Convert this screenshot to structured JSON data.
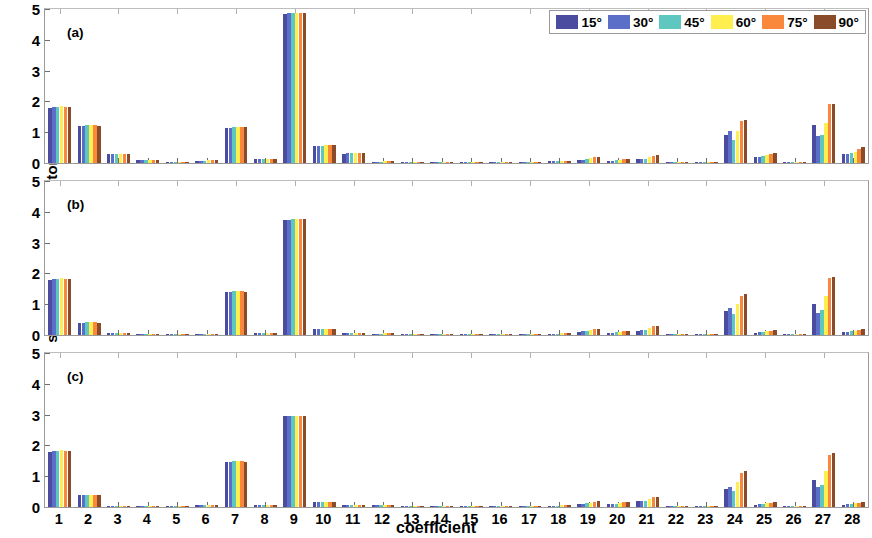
{
  "chart_data": {
    "type": "bar",
    "title": "",
    "xlabel": "coefficient",
    "ylabel": "sensitivity analysis factors",
    "ylim": [
      0,
      5
    ],
    "yticks": [
      0,
      1,
      2,
      3,
      4,
      5
    ],
    "grid": false,
    "legend_position": "top-right",
    "categories": [
      1,
      2,
      3,
      4,
      5,
      6,
      7,
      8,
      9,
      10,
      11,
      12,
      13,
      14,
      15,
      16,
      17,
      18,
      19,
      20,
      21,
      22,
      23,
      24,
      25,
      26,
      27,
      28
    ],
    "panels": [
      {
        "tag": "(a)",
        "series": [
          {
            "name": "15°",
            "color": "#4b4ba0",
            "values": [
              1.8,
              1.2,
              0.28,
              0.1,
              0.01,
              0.08,
              1.14,
              0.13,
              4.85,
              0.55,
              0.3,
              0.04,
              0.02,
              0.01,
              0.01,
              0.01,
              0.01,
              0.06,
              0.1,
              0.07,
              0.12,
              0.02,
              0.02,
              0.92,
              0.18,
              0.02,
              1.25,
              0.28
            ]
          },
          {
            "name": "30°",
            "color": "#5b6ec8",
            "values": [
              1.82,
              1.21,
              0.28,
              0.1,
              0.01,
              0.08,
              1.15,
              0.13,
              4.86,
              0.56,
              0.31,
              0.04,
              0.02,
              0.01,
              0.01,
              0.01,
              0.01,
              0.06,
              0.11,
              0.08,
              0.13,
              0.02,
              0.02,
              1.04,
              0.2,
              0.02,
              0.88,
              0.3
            ]
          },
          {
            "name": "45°",
            "color": "#5ec8c0",
            "values": [
              1.83,
              1.22,
              0.29,
              0.1,
              0.01,
              0.08,
              1.16,
              0.13,
              4.87,
              0.56,
              0.31,
              0.04,
              0.02,
              0.01,
              0.01,
              0.01,
              0.01,
              0.06,
              0.12,
              0.09,
              0.14,
              0.02,
              0.02,
              0.76,
              0.22,
              0.02,
              0.92,
              0.32
            ]
          },
          {
            "name": "60°",
            "color": "#ffef4e",
            "values": [
              1.84,
              1.22,
              0.29,
              0.11,
              0.01,
              0.09,
              1.17,
              0.14,
              4.88,
              0.57,
              0.32,
              0.05,
              0.02,
              0.01,
              0.01,
              0.01,
              0.01,
              0.07,
              0.15,
              0.11,
              0.2,
              0.03,
              0.02,
              1.05,
              0.26,
              0.02,
              1.3,
              0.36
            ]
          },
          {
            "name": "75°",
            "color": "#f9873c",
            "values": [
              1.83,
              1.22,
              0.3,
              0.11,
              0.01,
              0.09,
              1.17,
              0.14,
              4.88,
              0.57,
              0.32,
              0.05,
              0.02,
              0.01,
              0.01,
              0.01,
              0.01,
              0.08,
              0.18,
              0.13,
              0.24,
              0.03,
              0.02,
              1.35,
              0.3,
              0.02,
              1.9,
              0.44
            ]
          },
          {
            "name": "90°",
            "color": "#8a4b2a",
            "values": [
              1.82,
              1.21,
              0.3,
              0.11,
              0.01,
              0.09,
              1.16,
              0.14,
              4.87,
              0.57,
              0.32,
              0.05,
              0.02,
              0.01,
              0.01,
              0.01,
              0.01,
              0.08,
              0.19,
              0.14,
              0.25,
              0.03,
              0.02,
              1.4,
              0.32,
              0.02,
              1.93,
              0.52
            ]
          }
        ]
      },
      {
        "tag": "(b)",
        "series": [
          {
            "name": "15°",
            "color": "#4b4ba0",
            "values": [
              1.8,
              0.4,
              0.05,
              0.01,
              0.01,
              0.03,
              1.4,
              0.05,
              3.74,
              0.18,
              0.06,
              0.04,
              0.01,
              0.01,
              0.01,
              0.01,
              0.01,
              0.04,
              0.11,
              0.07,
              0.14,
              0.02,
              0.01,
              0.78,
              0.08,
              0.01,
              1.02,
              0.1
            ]
          },
          {
            "name": "30°",
            "color": "#5b6ec8",
            "values": [
              1.82,
              0.4,
              0.05,
              0.01,
              0.01,
              0.03,
              1.41,
              0.05,
              3.75,
              0.18,
              0.06,
              0.04,
              0.01,
              0.01,
              0.01,
              0.01,
              0.01,
              0.04,
              0.12,
              0.08,
              0.15,
              0.02,
              0.01,
              0.88,
              0.09,
              0.01,
              0.72,
              0.11
            ]
          },
          {
            "name": "45°",
            "color": "#5ec8c0",
            "values": [
              1.83,
              0.41,
              0.05,
              0.01,
              0.01,
              0.03,
              1.42,
              0.05,
              3.76,
              0.18,
              0.06,
              0.04,
              0.01,
              0.01,
              0.01,
              0.01,
              0.01,
              0.04,
              0.13,
              0.09,
              0.16,
              0.02,
              0.01,
              0.68,
              0.1,
              0.01,
              0.8,
              0.12
            ]
          },
          {
            "name": "60°",
            "color": "#ffef4e",
            "values": [
              1.84,
              0.41,
              0.05,
              0.01,
              0.01,
              0.03,
              1.42,
              0.05,
              3.77,
              0.19,
              0.06,
              0.05,
              0.01,
              0.01,
              0.01,
              0.01,
              0.01,
              0.05,
              0.16,
              0.11,
              0.22,
              0.03,
              0.01,
              1.0,
              0.12,
              0.01,
              1.28,
              0.14
            ]
          },
          {
            "name": "75°",
            "color": "#f9873c",
            "values": [
              1.83,
              0.41,
              0.05,
              0.01,
              0.01,
              0.03,
              1.42,
              0.05,
              3.77,
              0.19,
              0.06,
              0.05,
              0.01,
              0.01,
              0.01,
              0.01,
              0.01,
              0.06,
              0.19,
              0.13,
              0.28,
              0.03,
              0.01,
              1.28,
              0.14,
              0.01,
              1.86,
              0.17
            ]
          },
          {
            "name": "90°",
            "color": "#8a4b2a",
            "values": [
              1.82,
              0.4,
              0.05,
              0.01,
              0.01,
              0.03,
              1.41,
              0.05,
              3.76,
              0.19,
              0.06,
              0.05,
              0.01,
              0.01,
              0.01,
              0.01,
              0.01,
              0.06,
              0.2,
              0.14,
              0.3,
              0.03,
              0.01,
              1.34,
              0.15,
              0.01,
              1.88,
              0.18
            ]
          }
        ]
      },
      {
        "tag": "(c)",
        "series": [
          {
            "name": "15°",
            "color": "#4b4ba0",
            "values": [
              1.8,
              0.38,
              0.04,
              0.01,
              0.01,
              0.07,
              1.46,
              0.05,
              2.94,
              0.16,
              0.05,
              0.05,
              0.02,
              0.02,
              0.02,
              0.02,
              0.02,
              0.04,
              0.1,
              0.09,
              0.18,
              0.02,
              0.01,
              0.58,
              0.08,
              0.01,
              0.88,
              0.08
            ]
          },
          {
            "name": "30°",
            "color": "#5b6ec8",
            "values": [
              1.82,
              0.38,
              0.04,
              0.01,
              0.01,
              0.07,
              1.47,
              0.05,
              2.95,
              0.16,
              0.05,
              0.05,
              0.02,
              0.02,
              0.02,
              0.02,
              0.02,
              0.04,
              0.11,
              0.1,
              0.19,
              0.02,
              0.01,
              0.66,
              0.09,
              0.01,
              0.64,
              0.09
            ]
          },
          {
            "name": "45°",
            "color": "#5ec8c0",
            "values": [
              1.83,
              0.39,
              0.04,
              0.01,
              0.01,
              0.07,
              1.48,
              0.05,
              2.96,
              0.16,
              0.05,
              0.05,
              0.02,
              0.02,
              0.02,
              0.02,
              0.02,
              0.04,
              0.12,
              0.11,
              0.2,
              0.02,
              0.01,
              0.52,
              0.1,
              0.01,
              0.72,
              0.1
            ]
          },
          {
            "name": "60°",
            "color": "#ffef4e",
            "values": [
              1.84,
              0.39,
              0.04,
              0.01,
              0.01,
              0.07,
              1.48,
              0.05,
              2.97,
              0.17,
              0.05,
              0.06,
              0.02,
              0.02,
              0.02,
              0.02,
              0.02,
              0.05,
              0.14,
              0.13,
              0.26,
              0.03,
              0.01,
              0.8,
              0.12,
              0.01,
              1.18,
              0.12
            ]
          },
          {
            "name": "75°",
            "color": "#f9873c",
            "values": [
              1.83,
              0.39,
              0.04,
              0.01,
              0.01,
              0.07,
              1.48,
              0.05,
              2.97,
              0.17,
              0.05,
              0.06,
              0.02,
              0.02,
              0.02,
              0.02,
              0.02,
              0.06,
              0.17,
              0.15,
              0.31,
              0.03,
              0.01,
              1.1,
              0.14,
              0.01,
              1.7,
              0.14
            ]
          },
          {
            "name": "90°",
            "color": "#8a4b2a",
            "values": [
              1.82,
              0.38,
              0.04,
              0.01,
              0.01,
              0.07,
              1.47,
              0.05,
              2.96,
              0.17,
              0.05,
              0.06,
              0.02,
              0.02,
              0.02,
              0.02,
              0.02,
              0.06,
              0.18,
              0.16,
              0.32,
              0.03,
              0.01,
              1.16,
              0.15,
              0.01,
              1.74,
              0.15
            ]
          }
        ]
      }
    ],
    "legend": [
      {
        "label": "15°",
        "color": "#4b4ba0"
      },
      {
        "label": "30°",
        "color": "#5b6ec8"
      },
      {
        "label": "45°",
        "color": "#5ec8c0"
      },
      {
        "label": "60°",
        "color": "#ffef4e"
      },
      {
        "label": "75°",
        "color": "#f9873c"
      },
      {
        "label": "90°",
        "color": "#8a4b2a"
      }
    ]
  }
}
